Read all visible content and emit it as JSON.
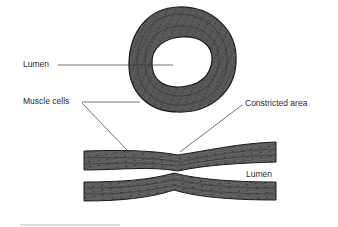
{
  "diagram": {
    "type": "anatomical illustration",
    "colors": {
      "tissue_fill": "#6e6e6e",
      "tissue_outline": "#1a1a1a",
      "background": "#ffffff",
      "leader_line": "#333333"
    },
    "labels": {
      "lumen_top": "Lumen",
      "muscle_cells": "Muscle cells",
      "constricted_area": "Constricted area",
      "lumen_bottom": "Lumen"
    },
    "parts": [
      {
        "id": "cross-section-ring",
        "description": "Circular vessel wall of muscle cells surrounding a hollow lumen"
      },
      {
        "id": "longitudinal-upper-wall",
        "description": "Upper vessel wall in longitudinal section, dipping at constriction"
      },
      {
        "id": "longitudinal-lower-wall",
        "description": "Lower vessel wall in longitudinal section, bulging at constriction"
      }
    ]
  }
}
